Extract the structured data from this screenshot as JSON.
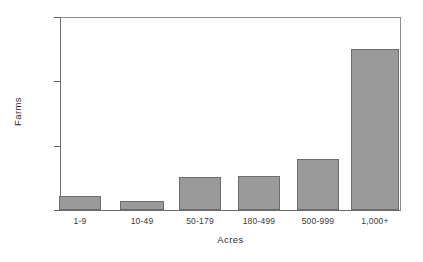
{
  "chart_data": {
    "type": "bar",
    "title": "",
    "xlabel": "Acres",
    "ylabel": "Farms",
    "categories": [
      "1-9",
      "10-49",
      "50-179",
      "180-499",
      "500-999",
      "1,000+"
    ],
    "values": [
      22,
      14,
      51,
      53,
      79,
      250
    ],
    "ylim": [
      0,
      300
    ],
    "yticks": [
      0,
      100,
      200,
      300
    ],
    "ytick_labels": [
      "0",
      "100",
      "200",
      "300"
    ],
    "grid": false,
    "legend": null,
    "bar_color": "#9a9a9a",
    "bar_edge_color": "#6d6d6d",
    "axis_color": "#6b6b6b",
    "background": "#ffffff"
  }
}
